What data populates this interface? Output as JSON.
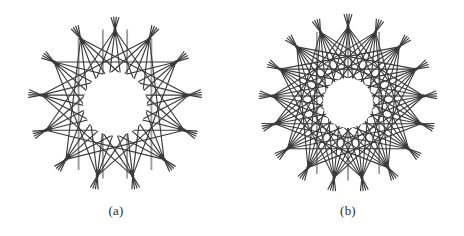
{
  "figure": {
    "background_color": "#ffffff",
    "stroke_color": "#3a3a3a",
    "subfigures": [
      {
        "id": "a",
        "caption": "(a)",
        "name": "star-polygon-diagram-a",
        "description": "star polygon line drawing with spiked outer points and open circular center",
        "geometry": {
          "center_x": 115,
          "center_y": 104,
          "outer_radius": 88,
          "vertex_radius": 74,
          "inner_hole_radius": 33,
          "point_count": 13,
          "chord_steps": [
            4,
            5,
            6
          ],
          "spike_length": 13,
          "stroke_width": 1.15,
          "vertical_bar_count": 4,
          "vertical_bar_color": "#9a9a9a"
        }
      },
      {
        "id": "b",
        "caption": "(b)",
        "name": "star-polygon-diagram-b",
        "description": "denser star polygon line drawing with more outer points and smaller open circular center",
        "geometry": {
          "center_x": 116,
          "center_y": 103,
          "outer_radius": 90,
          "vertex_radius": 76,
          "inner_hole_radius": 26,
          "point_count": 17,
          "chord_steps": [
            5,
            6,
            7,
            8
          ],
          "spike_length": 13,
          "stroke_width": 1.1,
          "vertical_bar_count": 3,
          "vertical_bar_color": "#9a9a9a"
        }
      }
    ]
  }
}
